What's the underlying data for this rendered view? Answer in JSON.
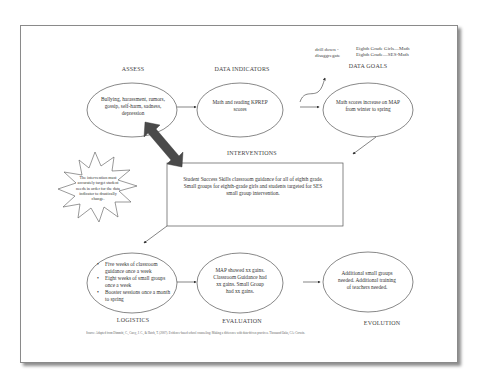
{
  "diagram": {
    "stages": {
      "assess": {
        "label": "ASSESS",
        "text": "Bullying, harassment, rumors, gossip, self-harm, sadness, depression"
      },
      "data_indicators": {
        "label": "DATA INDICATORS",
        "text": "Math and reading KPREP scores"
      },
      "data_goals": {
        "label": "DATA GOALS",
        "text": "Math scores increase on MAP from winter to spring"
      },
      "interventions": {
        "label": "INTERVENTIONS",
        "text": "Student Success Skills classroom guidance for all of eighth grade. Small groups for eighth-grade girls and students targeted for SES small group intervention."
      },
      "logistics": {
        "label": "LOGISTICS",
        "bullets": [
          "Five weeks of classroom guidance once a week",
          "Eight weeks of small groups once a week",
          "Booster sessions once a month to spring"
        ]
      },
      "evaluation": {
        "label": "EVALUATION",
        "text": "MAP showed xx gains. Classroom Guidance had xx gains. Small Group had xx gains."
      },
      "evolution": {
        "label": "EVOLUTION",
        "text": "Additional small groups needed. Additional training of teachers needed."
      }
    },
    "drill_down": {
      "line1": "drill down -",
      "line2": "disaggregate"
    },
    "targets": {
      "line1": "Eighth Grade Girls—Math",
      "line2": "Eighth Grade—SES-Math"
    },
    "callout": {
      "text": "The intervention must accurately target student needs in order for the data indicator to drastically change."
    },
    "source": "Source: Adapted from Dimmitt, C., Carey, J. C., & Hatch, T. (2007). Evidence-based school counseling: Making a difference with data-driven practices. Thousand Oaks, CA: Corwin."
  },
  "colors": {
    "page_border": "#8a8a8a",
    "shape_stroke": "#555555",
    "double_arrow": "#4a4a4a",
    "text": "#333333"
  }
}
